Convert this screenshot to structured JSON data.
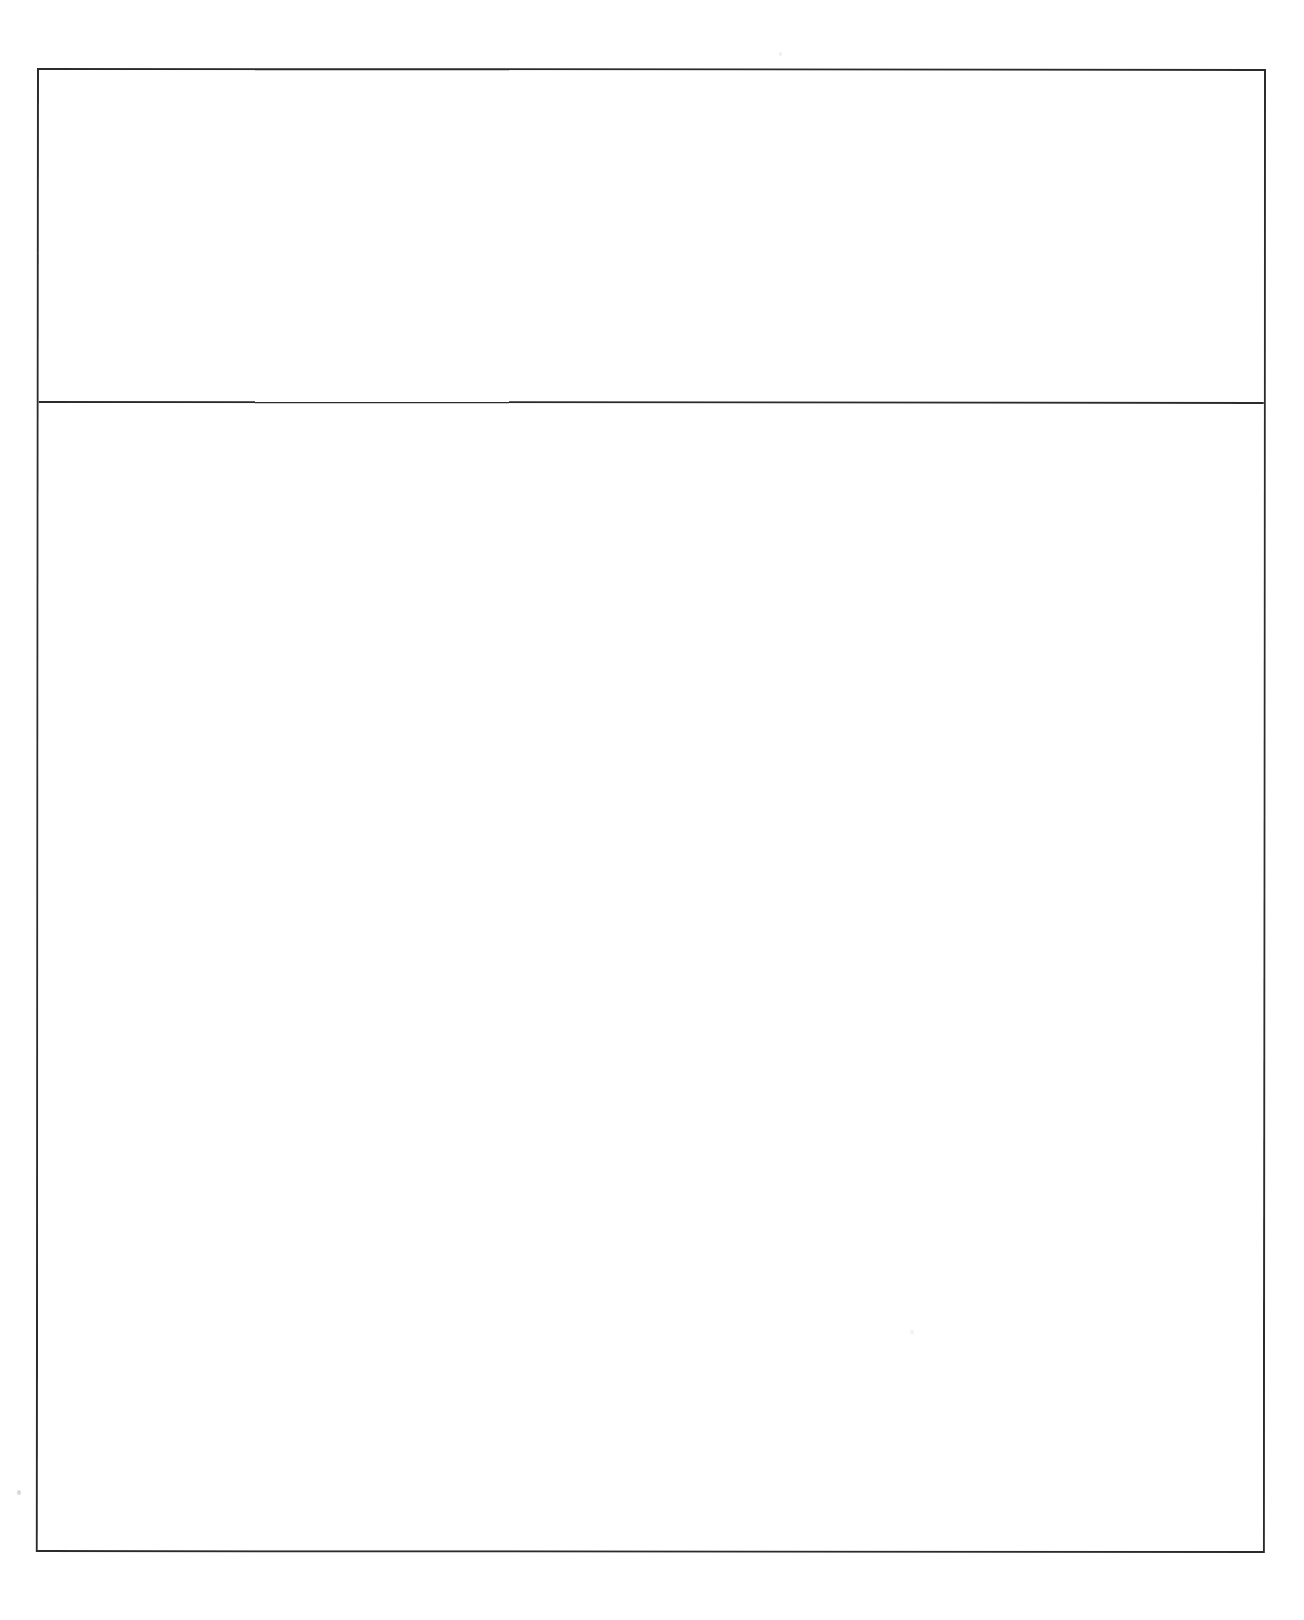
{
  "document": {
    "kind": "blank-form",
    "background_color": "#ffffff",
    "line_color": "#2b2b2b",
    "page_width": 1304,
    "page_height": 1620
  },
  "form": {
    "frame": {
      "x": 37,
      "y": 68,
      "width": 1229,
      "height": 1484,
      "border_width_px": 2
    },
    "divider": {
      "y": 403,
      "line_width_px": 2
    },
    "cells": [
      {
        "name": "top-cell",
        "height": 333,
        "text": ""
      },
      {
        "name": "bottom-cell",
        "height": 1147,
        "text": ""
      }
    ]
  },
  "artifacts": [
    {
      "name": "speck-left-margin",
      "x": 17,
      "y": 1490
    },
    {
      "name": "speck-lower-cell",
      "x": 909,
      "y": 1329
    },
    {
      "name": "speck-upper-margin",
      "x": 779,
      "y": 52
    }
  ]
}
